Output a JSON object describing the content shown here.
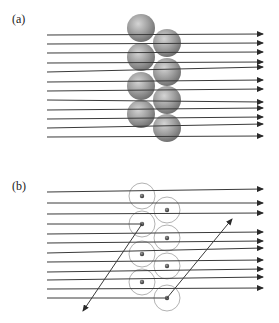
{
  "panels": [
    {
      "label": "(a)",
      "label_pos": [
        12,
        23
      ],
      "description": "Beam of parallel rays passing through a bilayer of solid spheres; some rays deflected",
      "sphere_style": "shaded",
      "spheres": [
        {
          "cx": 141,
          "cy": 28,
          "r": 14
        },
        {
          "cx": 141,
          "cy": 57,
          "r": 14
        },
        {
          "cx": 141,
          "cy": 86,
          "r": 14
        },
        {
          "cx": 141,
          "cy": 114,
          "r": 14
        },
        {
          "cx": 167,
          "cy": 43,
          "r": 14
        },
        {
          "cx": 167,
          "cy": 72,
          "r": 14
        },
        {
          "cx": 167,
          "cy": 100,
          "r": 14
        },
        {
          "cx": 167,
          "cy": 128,
          "r": 14
        }
      ],
      "rays": [
        {
          "x1": 47,
          "y1": 35,
          "x2": 263,
          "y2": 34
        },
        {
          "x1": 47,
          "y1": 44,
          "x2": 263,
          "y2": 43
        },
        {
          "x1": 47,
          "y1": 53,
          "x2": 263,
          "y2": 52
        },
        {
          "x1": 47,
          "y1": 63,
          "x2": 263,
          "y2": 62
        },
        {
          "x1": 47,
          "y1": 72,
          "x2": 263,
          "y2": 67
        },
        {
          "x1": 47,
          "y1": 82,
          "x2": 263,
          "y2": 80
        },
        {
          "x1": 47,
          "y1": 91,
          "x2": 263,
          "y2": 89
        },
        {
          "x1": 47,
          "y1": 100,
          "x2": 263,
          "y2": 102
        },
        {
          "x1": 47,
          "y1": 110,
          "x2": 263,
          "y2": 108
        },
        {
          "x1": 47,
          "y1": 119,
          "x2": 263,
          "y2": 117
        },
        {
          "x1": 47,
          "y1": 128,
          "x2": 263,
          "y2": 124
        },
        {
          "x1": 47,
          "y1": 137,
          "x2": 263,
          "y2": 136
        }
      ]
    },
    {
      "label": "(b)",
      "label_pos": [
        12,
        190
      ],
      "description": "Same beam through bilayer drawn as outlined spheres with small nuclei; two rays scattered at large angles",
      "sphere_style": "outline-with-nucleus",
      "spheres": [
        {
          "cx": 142,
          "cy": 196,
          "r": 13
        },
        {
          "cx": 142,
          "cy": 224,
          "r": 13
        },
        {
          "cx": 142,
          "cy": 254,
          "r": 13
        },
        {
          "cx": 142,
          "cy": 282,
          "r": 13
        },
        {
          "cx": 167,
          "cy": 210,
          "r": 13
        },
        {
          "cx": 167,
          "cy": 238,
          "r": 13
        },
        {
          "cx": 167,
          "cy": 266,
          "r": 13
        },
        {
          "cx": 167,
          "cy": 298,
          "r": 13
        }
      ],
      "rays": [
        {
          "x1": 47,
          "y1": 192,
          "x2": 263,
          "y2": 189
        },
        {
          "x1": 47,
          "y1": 203,
          "x2": 263,
          "y2": 203
        },
        {
          "x1": 47,
          "y1": 214,
          "x2": 263,
          "y2": 213
        },
        {
          "x1": 47,
          "y1": 234,
          "x2": 263,
          "y2": 232
        },
        {
          "x1": 47,
          "y1": 243,
          "x2": 263,
          "y2": 241
        },
        {
          "x1": 47,
          "y1": 253,
          "x2": 263,
          "y2": 248
        },
        {
          "x1": 47,
          "y1": 262,
          "x2": 263,
          "y2": 260
        },
        {
          "x1": 47,
          "y1": 272,
          "x2": 263,
          "y2": 269
        },
        {
          "x1": 47,
          "y1": 280,
          "x2": 263,
          "y2": 277
        },
        {
          "x1": 47,
          "y1": 289,
          "x2": 263,
          "y2": 288
        }
      ],
      "scattered_rays": [
        {
          "incoming": {
            "x1": 47,
            "y1": 224,
            "x2": 142,
            "y2": 224
          },
          "outgoing": {
            "x1": 142,
            "y1": 224,
            "x2": 83,
            "y2": 311
          }
        },
        {
          "incoming": {
            "x1": 47,
            "y1": 298,
            "x2": 167,
            "y2": 298
          },
          "outgoing": {
            "x1": 167,
            "y1": 298,
            "x2": 232,
            "y2": 219
          }
        }
      ]
    }
  ],
  "colors": {
    "ray": "#3a3a3a",
    "sphere_light": "#c9c9c9",
    "sphere_mid": "#9a9a9a",
    "sphere_dark": "#6e6e6e",
    "outline": "#9e9e9e",
    "nucleus": "#444444"
  }
}
